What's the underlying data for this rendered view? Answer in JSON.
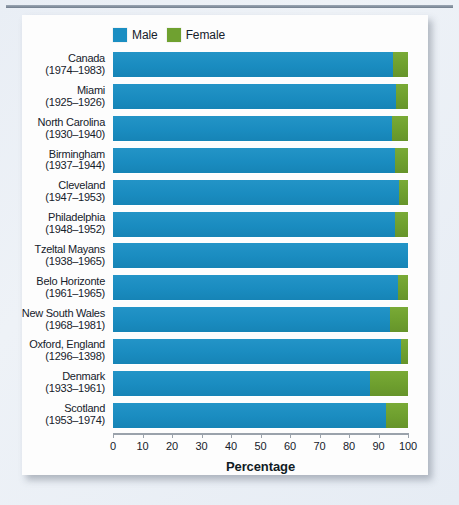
{
  "figure": {
    "legend": [
      {
        "label": "Male",
        "color": "#1b8ec2",
        "key": "male"
      },
      {
        "label": "Female",
        "color": "#6fa130",
        "key": "female"
      }
    ],
    "axis_title": "Percentage"
  },
  "chart_data": {
    "type": "bar",
    "orientation": "horizontal",
    "stacked": true,
    "title": "",
    "xlabel": "Percentage",
    "ylabel": "",
    "xlim": [
      0,
      100
    ],
    "xticks": [
      0,
      10,
      20,
      30,
      40,
      50,
      60,
      70,
      80,
      90,
      100
    ],
    "grid": false,
    "legend_position": "top-left",
    "categories": [
      "Canada",
      "Miami",
      "North Carolina",
      "Birmingham",
      "Cleveland",
      "Philadelphia",
      "Tzeltal Mayans",
      "Belo Horizonte",
      "New South Wales",
      "Oxford, England",
      "Denmark",
      "Scotland"
    ],
    "category_sublabels": [
      "(1974–1983)",
      "(1925–1926)",
      "(1930–1940)",
      "(1937–1944)",
      "(1947–1953)",
      "(1948–1952)",
      "(1938–1965)",
      "(1961–1965)",
      "(1968–1981)",
      "(1296–1398)",
      "(1933–1961)",
      "(1953–1974)"
    ],
    "series": [
      {
        "name": "Male",
        "color": "#1b8ec2",
        "values": [
          95,
          96,
          94.5,
          95.5,
          97,
          95.5,
          100,
          96.5,
          94,
          97.5,
          87,
          92.5
        ]
      },
      {
        "name": "Female",
        "color": "#6fa130",
        "values": [
          5,
          4,
          5.5,
          4.5,
          3,
          4.5,
          0,
          3.5,
          6,
          2.5,
          13,
          7.5
        ]
      }
    ]
  }
}
